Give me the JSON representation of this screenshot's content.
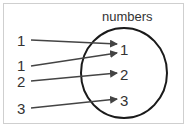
{
  "diagram": {
    "set_title": "numbers",
    "left_elements": [
      {
        "label": "1",
        "x": 15,
        "y": 33
      },
      {
        "label": "1",
        "x": 15,
        "y": 59
      },
      {
        "label": "2",
        "x": 15,
        "y": 74
      },
      {
        "label": "3",
        "x": 15,
        "y": 101
      }
    ],
    "right_elements": [
      {
        "label": "1",
        "x": 120,
        "y": 41
      },
      {
        "label": "2",
        "x": 120,
        "y": 66
      },
      {
        "label": "3",
        "x": 120,
        "y": 92
      }
    ],
    "arrows": [
      {
        "from": "1",
        "to": "1"
      },
      {
        "from": "1",
        "to": "1"
      },
      {
        "from": "2",
        "to": "2"
      },
      {
        "from": "3",
        "to": "3"
      }
    ],
    "colors": {
      "stroke": "#333333",
      "circle": "#1a1a1a",
      "border": "#cfcfcf"
    }
  }
}
